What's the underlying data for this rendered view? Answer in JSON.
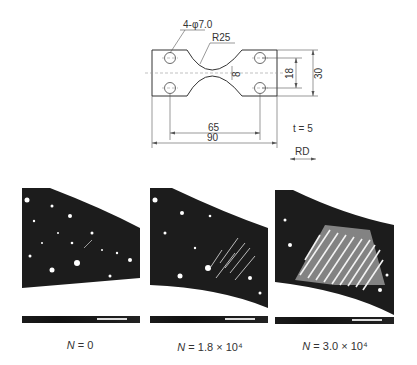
{
  "drawing": {
    "hole_label": "4-φ7.0",
    "radius_label": "R25",
    "gauge_width_label": "8",
    "inner_height_label": "18",
    "outer_height_label": "30",
    "inner_length_label": "65",
    "outer_length_label": "90",
    "thickness_label": "t = 5",
    "thickness_symbol": "t",
    "thickness_value": "= 5",
    "direction_label": "RD"
  },
  "micrographs": [
    {
      "id": "n0",
      "caption_var": "N",
      "caption_value": " = 0",
      "shear_band_density": 0.0
    },
    {
      "id": "n18e4",
      "caption_var": "N",
      "caption_value": " = 1.8 × 10⁴",
      "shear_band_density": 0.4
    },
    {
      "id": "n30e4",
      "caption_var": "N",
      "caption_value": " = 3.0 × 10⁴",
      "shear_band_density": 0.9
    }
  ],
  "colors": {
    "line": "#333333",
    "matrix_dark": "#1c1c1c",
    "background": "#ffffff"
  }
}
